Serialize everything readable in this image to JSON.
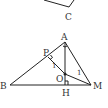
{
  "diagram": {
    "type": "geometry",
    "points": {
      "A": {
        "label": "A",
        "x": 65,
        "y": 42
      },
      "B": {
        "label": "B",
        "x": 10,
        "y": 85
      },
      "C": {
        "label": "C",
        "x": 69,
        "y": 7
      },
      "H": {
        "label": "H",
        "x": 65,
        "y": 85
      },
      "M": {
        "label": "M",
        "x": 91,
        "y": 85
      },
      "O": {
        "label": "O",
        "x": 65,
        "y": 74
      },
      "P": {
        "label": "P",
        "x": 48,
        "y": 57
      }
    },
    "segments": [
      [
        "B",
        "A"
      ],
      [
        "A",
        "M"
      ],
      [
        "B",
        "M"
      ],
      [
        "A",
        "H"
      ],
      [
        "P",
        "O"
      ],
      [
        "O",
        "M"
      ]
    ],
    "angle_labels": {
      "at_P": "1",
      "at_M": "1"
    },
    "colors": {
      "line": "#222222",
      "label": "#333333"
    }
  }
}
